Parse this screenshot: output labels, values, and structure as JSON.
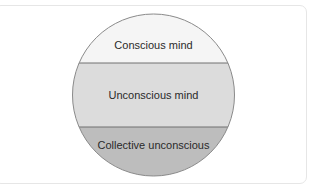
{
  "diagram": {
    "type": "layered-circle",
    "layers": [
      {
        "label": "Conscious mind",
        "color": "#f5f5f5"
      },
      {
        "label": "Unconscious mind",
        "color": "#dcdcdc"
      },
      {
        "label": "Collective unconscious",
        "color": "#bdbdbd"
      }
    ],
    "outline_color": "#8a8a8a",
    "divider_color": "#707070",
    "card_border_color": "#e6e6e6"
  }
}
